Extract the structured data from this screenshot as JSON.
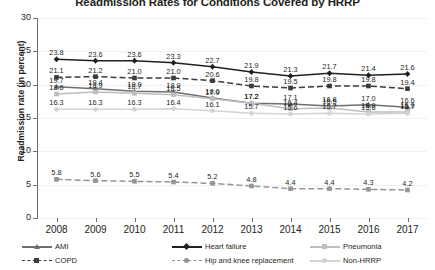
{
  "chart_data": {
    "type": "line",
    "title": "Readmission Rates for Conditions Covered by HRRP",
    "xlabel": "",
    "ylabel": "Readmission rate (in percent)",
    "ylim": [
      0,
      30
    ],
    "yticks": [
      0,
      5,
      10,
      15,
      20,
      25,
      30
    ],
    "grid": true,
    "legend_position": "bottom",
    "categories": [
      "2008",
      "2009",
      "2010",
      "2011",
      "2012",
      "2013",
      "2014",
      "2015",
      "2016",
      "2017"
    ],
    "series": [
      {
        "name": "Heart failure",
        "color": "#231f20",
        "style": "solid",
        "marker": "diamond",
        "values": [
          23.8,
          23.6,
          23.6,
          23.3,
          22.7,
          21.9,
          21.3,
          21.7,
          21.4,
          21.6
        ],
        "labels": [
          "23.8",
          "23.6",
          "23.6",
          "23.3",
          "22.7",
          "21.9",
          "21.3",
          "21.7",
          "21.4",
          "21.6"
        ]
      },
      {
        "name": "COPD",
        "color": "#3b3b3d",
        "style": "dashed",
        "marker": "square",
        "values": [
          21.1,
          21.2,
          21.0,
          21.0,
          20.6,
          19.8,
          19.5,
          19.8,
          19.8,
          19.4
        ],
        "labels": [
          "21.1",
          "21.2",
          "21.0",
          "21.0",
          "20.6",
          "19.8",
          "19.5",
          "19.8",
          "19.8",
          "19.4"
        ]
      },
      {
        "name": "AMI",
        "color": "#6d6e71",
        "style": "solid",
        "marker": "triangle",
        "values": [
          19.7,
          19.4,
          19.0,
          18.9,
          18.0,
          17.2,
          17.1,
          16.8,
          17.0,
          16.6
        ],
        "labels": [
          "19.7",
          "19.4",
          "19.0",
          "18.9",
          "18.0",
          "17.2",
          "17.1",
          "16.8",
          "17.0",
          "16.6"
        ]
      },
      {
        "name": "Pneumonia",
        "color": "#bcbec0",
        "style": "solid",
        "marker": "square",
        "values": [
          18.6,
          18.9,
          18.7,
          18.5,
          17.9,
          17.2,
          16.4,
          16.5,
          15.9,
          15.9
        ],
        "labels": [
          "18.6",
          "18.9",
          "18.7",
          "18.5",
          "17.9",
          "17.2",
          "16.4",
          "16.5",
          "15.9",
          "15.9"
        ]
      },
      {
        "name": "Non-HRRP",
        "color": "#d1d3d4",
        "style": "solid",
        "marker": "circle",
        "values": [
          16.3,
          16.3,
          16.3,
          16.4,
          16.1,
          15.7,
          15.6,
          15.7,
          15.6,
          15.7
        ],
        "labels": [
          "16.3",
          "16.3",
          "16.3",
          "16.4",
          "16.1",
          "15.7",
          "15.6",
          "15.7",
          "15.6",
          "15.7"
        ]
      },
      {
        "name": "Hip and knee replacement",
        "color": "#939598",
        "style": "dashed",
        "marker": "square",
        "values": [
          5.8,
          5.6,
          5.5,
          5.4,
          5.2,
          4.8,
          4.4,
          4.4,
          4.3,
          4.2
        ],
        "labels": [
          "5.8",
          "5.6",
          "5.5",
          "5.4",
          "5.2",
          "4.8",
          "4.4",
          "4.4",
          "4.3",
          "4.2"
        ]
      }
    ]
  },
  "legend": {
    "items": [
      {
        "label": "AMI",
        "color": "#6d6e71",
        "style": "solid",
        "marker": "triangle"
      },
      {
        "label": "Heart failure",
        "color": "#231f20",
        "style": "solid",
        "marker": "diamond"
      },
      {
        "label": "Pneumonia",
        "color": "#bcbec0",
        "style": "solid",
        "marker": "square"
      },
      {
        "label": "COPD",
        "color": "#3b3b3d",
        "style": "dashed",
        "marker": "square"
      },
      {
        "label": "Hip and knee replacement",
        "color": "#939598",
        "style": "dashed",
        "marker": "circle"
      },
      {
        "label": "Non-HRRP",
        "color": "#d1d3d4",
        "style": "solid",
        "marker": "circle"
      }
    ]
  }
}
